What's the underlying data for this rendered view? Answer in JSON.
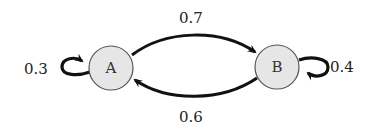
{
  "diagram": {
    "type": "markov-chain",
    "nodes": [
      {
        "id": "A",
        "label": "A",
        "fill": "#e6e6e6",
        "stroke": "#555555"
      },
      {
        "id": "B",
        "label": "B",
        "fill": "#e6e6e6",
        "stroke": "#555555"
      }
    ],
    "edges": [
      {
        "from": "A",
        "to": "B",
        "label": "0.7"
      },
      {
        "from": "B",
        "to": "A",
        "label": "0.6"
      },
      {
        "from": "A",
        "to": "A",
        "label": "0.3"
      },
      {
        "from": "B",
        "to": "B",
        "label": "0.4"
      }
    ],
    "edge_color": "#111111"
  }
}
